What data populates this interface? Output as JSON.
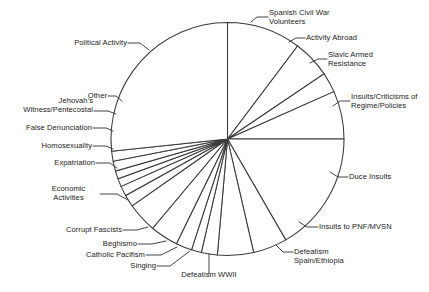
{
  "chart_data": {
    "type": "pie",
    "title": "",
    "subtitle": "",
    "xlabel": "",
    "ylabel": "",
    "grid": false,
    "legend": "none",
    "labels_position": "outside-with-leader-lines",
    "stroke_color": "#3a3a3a",
    "slice_fill": "#ffffff",
    "background": "#ffffff",
    "start_angle_deg": 0,
    "direction": "clockwise",
    "categories": [
      "Spanish Civil War Volunteers",
      "Activity Abroad",
      "Slavic Armed Resistance",
      "Insults/Criticisms of Regime/Policies",
      "Duce Insults",
      "Insults to PNF/MVSN",
      "Defeatism Spain/Ethiopia",
      "Defeatism WWII",
      "Singing",
      "Catholic Pacifism",
      "Beghismo",
      "Corrupt Fascists",
      "Economic Activities",
      "Expatriation",
      "Homosexuality",
      "False Denunciation",
      "Jehovah's Witness/Pentecostal",
      "Other",
      "Political Activity"
    ],
    "values": [
      10.3,
      5.3,
      2.8,
      6.7,
      16.7,
      16.7,
      4.7,
      5.0,
      2.2,
      1.4,
      2.2,
      3.9,
      4.2,
      1.7,
      1.4,
      1.1,
      1.1,
      1.4,
      11.2
    ],
    "value_unit": "percent",
    "slices": [
      {
        "label": "Spanish Civil War Volunteers",
        "start_deg": 0.0,
        "end_deg": 37.0,
        "value": 10.3
      },
      {
        "label": "Activity Abroad",
        "start_deg": 37.0,
        "end_deg": 56.0,
        "value": 5.3
      },
      {
        "label": "Slavic Armed Resistance",
        "start_deg": 56.0,
        "end_deg": 66.0,
        "value": 2.8
      },
      {
        "label": "Insults/Criticisms of Regime/Policies",
        "start_deg": 66.0,
        "end_deg": 90.0,
        "value": 6.7
      },
      {
        "label": "Duce Insults",
        "start_deg": 90.0,
        "end_deg": 150.0,
        "value": 16.7
      },
      {
        "label": "Insults to PNF/MVSN",
        "start_deg": 150.0,
        "end_deg": 167.0,
        "value": 4.7
      },
      {
        "label": "Defeatism Spain/Ethiopia",
        "start_deg": 167.0,
        "end_deg": 185.0,
        "value": 5.0
      },
      {
        "label": "Defeatism WWII",
        "start_deg": 185.0,
        "end_deg": 193.0,
        "value": 2.2
      },
      {
        "label": "Singing",
        "start_deg": 193.0,
        "end_deg": 198.0,
        "value": 1.4
      },
      {
        "label": "Catholic Pacifism",
        "start_deg": 198.0,
        "end_deg": 206.0,
        "value": 2.2
      },
      {
        "label": "Beghismo",
        "start_deg": 206.0,
        "end_deg": 220.0,
        "value": 3.9
      },
      {
        "label": "Corrupt Fascists",
        "start_deg": 220.0,
        "end_deg": 235.0,
        "value": 4.2
      },
      {
        "label": "Economic Activities",
        "start_deg": 235.0,
        "end_deg": 241.0,
        "value": 1.7
      },
      {
        "label": "Expatriation",
        "start_deg": 241.0,
        "end_deg": 246.0,
        "value": 1.4
      },
      {
        "label": "Homosexuality",
        "start_deg": 246.0,
        "end_deg": 250.0,
        "value": 1.1
      },
      {
        "label": "False Denunciation",
        "start_deg": 250.0,
        "end_deg": 254.0,
        "value": 1.1
      },
      {
        "label": "Jehovah's Witness/Pentecostal",
        "start_deg": 254.0,
        "end_deg": 259.0,
        "value": 1.4
      },
      {
        "label": "Other",
        "start_deg": 259.0,
        "end_deg": 264.0,
        "value": 1.4
      },
      {
        "label": "Political Activity",
        "start_deg": 264.0,
        "end_deg": 360.0,
        "value": 26.7
      }
    ]
  },
  "labels": {
    "spanish_civil_war": "Spanish Civil War\nVolunteers",
    "activity_abroad": "Activity Abroad",
    "slavic_armed_resistance": "Slavic Armed\nResistance",
    "insults_criticisms_regime": "Insults/Criticisms of\nRegime/Policies",
    "duce_insults": "Duce Insults",
    "insults_pnf_mvsn": "Insults to PNF/MVSN",
    "defeatism_spain_ethiopia": "Defeatism\nSpain/Ethiopia",
    "defeatism_wwii": "Defeatism WWII",
    "singing": "Singing",
    "catholic_pacifism": "Catholic Pacifism",
    "beghismo": "Beghismo",
    "corrupt_fascists": "Corrupt Fascists",
    "economic_activities": "Economic\nActivities",
    "expatriation": "Expatriation",
    "homosexuality": "Homosexuality",
    "false_denunciation": "False Denunciation",
    "jehovahs_witness": "Jehovah's\nWitness/Pentecostal",
    "other": "Other",
    "political_activity": "Political Activity"
  }
}
